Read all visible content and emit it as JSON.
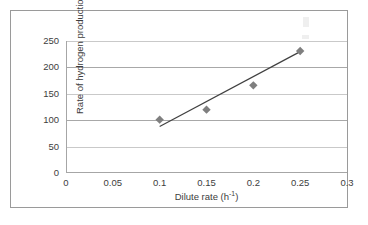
{
  "figure": {
    "border_color": "#9a9a9a",
    "background": "#ffffff"
  },
  "chart_data": {
    "type": "scatter",
    "title": "",
    "xlabel": "Dilute rate (h-1)",
    "ylabel": "Rate of hydrogen production (mL L-1 h-1)",
    "xlabel_parts": {
      "text": "Dilute rate (h",
      "sup": "-1",
      "tail": ")"
    },
    "ylabel_parts": {
      "text": "Rate of hydrogen production (mL L",
      "sup1": "-1",
      "mid": " h",
      "sup2": "-1",
      "tail": ")"
    },
    "x": [
      0.1,
      0.15,
      0.2,
      0.25
    ],
    "values": [
      101,
      120,
      166,
      231
    ],
    "series": [
      {
        "name": "Hydrogen production rate",
        "marker": "diamond",
        "marker_color": "#7f7f7f",
        "points": [
          {
            "x": 0.1,
            "y": 101
          },
          {
            "x": 0.15,
            "y": 120
          },
          {
            "x": 0.2,
            "y": 166
          },
          {
            "x": 0.25,
            "y": 231
          }
        ]
      }
    ],
    "trendline": {
      "type": "linear",
      "color": "#404040",
      "x_start": 0.1,
      "y_start": 88,
      "x_end": 0.248,
      "y_end": 228
    },
    "xlim": [
      0,
      0.3
    ],
    "ylim": [
      0,
      250
    ],
    "xticks": [
      0,
      0.05,
      0.1,
      0.15,
      0.2,
      0.25,
      0.3
    ],
    "xticklabels": [
      "0",
      "0.05",
      "0.1",
      "0.15",
      "0.2",
      "0.25",
      "0.3"
    ],
    "yticks": [
      0,
      50,
      100,
      150,
      200,
      250
    ],
    "yticklabels": [
      "0",
      "50",
      "100",
      "150",
      "200",
      "250"
    ],
    "grid": {
      "horizontal": true,
      "vertical": false,
      "color": "#c9c9c9"
    },
    "legend": {
      "visible": false,
      "position": "none"
    },
    "axis_line_color": "#a6a6a6"
  }
}
